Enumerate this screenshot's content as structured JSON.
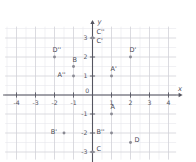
{
  "chart_data": {
    "type": "scatter",
    "title": "",
    "subtitle": "",
    "xlabel": "x",
    "ylabel": "y",
    "xlim": [
      -4.6,
      4.4
    ],
    "ylim": [
      -3.4,
      3.6
    ],
    "grid": true,
    "grid_step": 0.5,
    "legend": "none",
    "x_ticks": [
      "-4",
      "-3",
      "-2",
      "-1",
      "0",
      "1",
      "2",
      "3",
      "4"
    ],
    "x_tick_values": [
      -4,
      -3,
      -2,
      -1,
      0,
      1,
      2,
      3,
      4
    ],
    "y_ticks": [
      "3",
      "2",
      "1",
      "-1",
      "-2",
      "-3"
    ],
    "y_tick_values": [
      3,
      2,
      1,
      -1,
      -2,
      -3
    ],
    "origin_label": "0",
    "points": [
      {
        "label": "A",
        "x": 1,
        "y": -1,
        "label_dx": -1,
        "label_dy": -5
      },
      {
        "label": "B",
        "x": -1,
        "y": 1.5,
        "label_dx": -1,
        "label_dy": -5
      },
      {
        "label": "C",
        "x": 0,
        "y": -3,
        "label_dx": 4,
        "label_dy": -1
      },
      {
        "label": "D",
        "x": 2,
        "y": -2.5,
        "label_dx": 4,
        "label_dy": -1
      },
      {
        "label": "A'",
        "x": 1,
        "y": 1,
        "label_dx": -1,
        "label_dy": -5
      },
      {
        "label": "B'",
        "x": -1.5,
        "y": -2,
        "label_dx": -7,
        "label_dy": 1
      },
      {
        "label": "C'",
        "x": 0,
        "y": 3,
        "label_dx": 4,
        "label_dy": 5
      },
      {
        "label": "D'",
        "x": 2,
        "y": 2,
        "label_dx": -1,
        "label_dy": -5
      },
      {
        "label": "A''",
        "x": -1,
        "y": 1,
        "label_dx": -8,
        "label_dy": 1
      },
      {
        "label": "B''",
        "x": 1,
        "y": -2,
        "label_dx": -7,
        "label_dy": 1
      },
      {
        "label": "C''",
        "x": 0,
        "y": 3,
        "label_dx": 4,
        "label_dy": -4
      },
      {
        "label": "D''",
        "x": -2,
        "y": 2,
        "label_dx": -2,
        "label_dy": -5
      }
    ],
    "colors": {
      "background": "#ffffff",
      "grid_minor": "#e8e8ec",
      "grid_major": "#d2d2d8",
      "axis": "#555560",
      "point": "#8a8a93",
      "text": "#4a4a55"
    }
  }
}
